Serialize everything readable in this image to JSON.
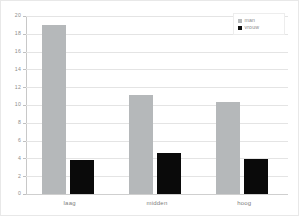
{
  "chart_data": {
    "type": "bar",
    "title": "",
    "xlabel": "",
    "ylabel": "",
    "categories": [
      "laag",
      "midden",
      "hoog"
    ],
    "series": [
      {
        "name": "man",
        "color": "#b5b8ba",
        "values": [
          19.0,
          11.1,
          10.3
        ]
      },
      {
        "name": "vrouw",
        "color": "#0a0a0a",
        "values": [
          3.85,
          4.6,
          3.9
        ]
      }
    ],
    "ylim": [
      0,
      20
    ],
    "yticks": [
      0,
      2,
      4,
      6,
      8,
      10,
      12,
      14,
      16,
      18,
      20
    ],
    "ytick_labels": [
      "0",
      "2",
      "4",
      "6",
      "8",
      "10",
      "12",
      "14",
      "16",
      "18",
      "20"
    ],
    "grid": true,
    "grid_axis": "y",
    "legend_position": "top-right",
    "legend_entries": [
      "man",
      "vrouw"
    ]
  },
  "legend": {
    "items": [
      {
        "label": "man",
        "swatch": "legend-swatch-man"
      },
      {
        "label": "vrouw",
        "swatch": "legend-swatch-vrouw"
      }
    ]
  }
}
